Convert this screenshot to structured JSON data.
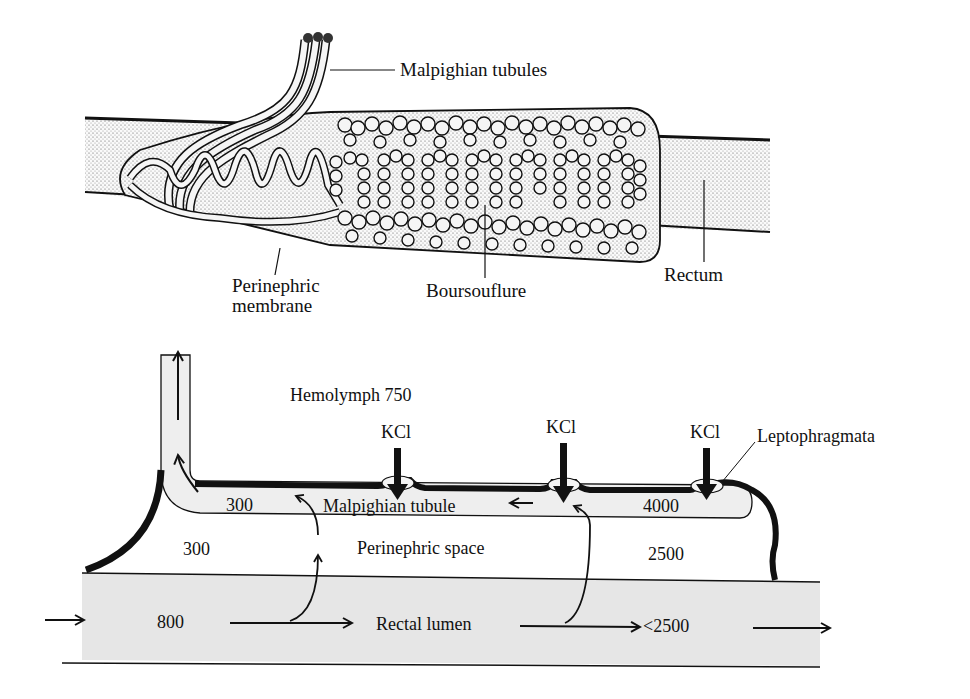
{
  "top_figure": {
    "labels": {
      "malpighian_tubules": "Malpighian tubules",
      "perinephric_membrane_line1": "Perinephric",
      "perinephric_membrane_line2": "membrane",
      "boursouflure": "Boursouflure",
      "rectum": "Rectum"
    }
  },
  "bottom_figure": {
    "hemolymph": "Hemolymph 750",
    "kcl_labels": [
      "KCl",
      "KCl",
      "KCl"
    ],
    "leptophragmata": "Leptophragmata",
    "malpighian_tubule": "Malpighian tubule",
    "perinephric_space": "Perinephric space",
    "rectal_lumen": "Rectal lumen",
    "values": {
      "tubule_left": "300",
      "tubule_right": "4000",
      "perinephric_left": "300",
      "perinephric_right": "2500",
      "lumen_in": "800",
      "lumen_out": "<2500"
    }
  },
  "colors": {
    "ink": "#111111",
    "fill_gray": "#e6e6e6",
    "stipple": "#d0d0d0"
  }
}
